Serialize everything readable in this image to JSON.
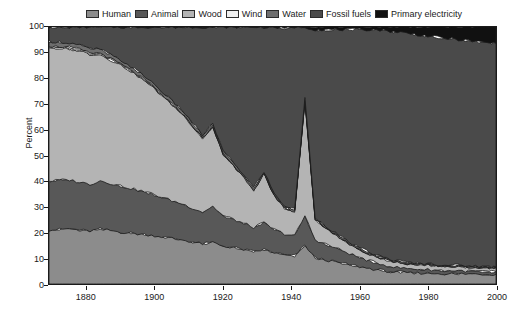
{
  "chart_data": {
    "type": "area",
    "stacked": true,
    "title": "",
    "xlabel": "",
    "ylabel": "Percent",
    "xlim": [
      1869,
      2000
    ],
    "ylim": [
      0,
      100
    ],
    "xticks": [
      1880,
      1900,
      1920,
      1940,
      1960,
      1980,
      2000
    ],
    "yticks": [
      0,
      10,
      20,
      30,
      40,
      50,
      60,
      70,
      80,
      90,
      100
    ],
    "grid": false,
    "legend_position": "top-center",
    "legend": [
      "Human",
      "Animal",
      "Wood",
      "Wind",
      "Water",
      "Fossil fuels",
      "Primary electricity"
    ],
    "colors": {
      "Human": "#8c8c8c",
      "Animal": "#585858",
      "Wood": "#b4b4b4",
      "Wind": "#efefef",
      "Water": "#6e6e6e",
      "Fossil fuels": "#4a4a4a",
      "Primary electricity": "#111111",
      "axis": "#1a1a1a",
      "background": "#ffffff"
    },
    "x": [
      1869,
      1872,
      1875,
      1878,
      1881,
      1884,
      1887,
      1890,
      1893,
      1896,
      1899,
      1902,
      1905,
      1908,
      1911,
      1914,
      1917,
      1920,
      1923,
      1926,
      1929,
      1932,
      1935,
      1938,
      1941,
      1944,
      1947,
      1950,
      1953,
      1956,
      1959,
      1962,
      1965,
      1968,
      1971,
      1974,
      1977,
      1980,
      1983,
      1986,
      1989,
      1992,
      1995,
      1998,
      2000
    ],
    "series": [
      {
        "name": "Human",
        "values": [
          21.0,
          21.2,
          21.5,
          21.0,
          20.6,
          21.4,
          20.8,
          20.2,
          19.8,
          19.4,
          19.0,
          18.4,
          17.8,
          17.2,
          16.4,
          15.6,
          16.2,
          14.8,
          14.2,
          13.4,
          12.6,
          13.4,
          12.2,
          11.4,
          11.0,
          15.0,
          10.2,
          9.4,
          8.6,
          7.8,
          7.0,
          6.2,
          5.6,
          5.0,
          4.6,
          4.4,
          4.3,
          4.2,
          4.1,
          4.0,
          4.0,
          3.9,
          3.9,
          3.8,
          3.8
        ]
      },
      {
        "name": "Animal",
        "values": [
          19.0,
          19.2,
          19.0,
          18.6,
          18.2,
          18.8,
          18.4,
          18.0,
          17.4,
          16.8,
          16.2,
          15.4,
          14.6,
          14.0,
          13.2,
          12.4,
          14.0,
          11.8,
          11.0,
          10.2,
          9.4,
          10.4,
          9.0,
          8.2,
          7.8,
          11.5,
          7.0,
          6.2,
          5.4,
          4.6,
          3.8,
          3.2,
          2.6,
          2.2,
          1.8,
          1.6,
          1.5,
          1.4,
          1.3,
          1.2,
          1.2,
          1.1,
          1.1,
          1.0,
          1.0
        ]
      },
      {
        "name": "Wood",
        "values": [
          52.0,
          51.4,
          51.0,
          51.2,
          50.6,
          49.2,
          48.0,
          47.0,
          45.6,
          43.8,
          42.0,
          39.6,
          37.4,
          35.0,
          32.0,
          28.6,
          31.0,
          24.0,
          21.0,
          18.0,
          14.6,
          19.0,
          13.0,
          10.2,
          9.4,
          45.0,
          8.0,
          6.4,
          5.0,
          4.0,
          3.2,
          2.8,
          2.4,
          2.2,
          2.0,
          1.9,
          1.8,
          1.8,
          1.7,
          1.7,
          1.6,
          1.6,
          1.5,
          1.5,
          1.5
        ]
      },
      {
        "name": "Wind",
        "values": [
          0.6,
          0.6,
          0.6,
          0.5,
          0.5,
          0.5,
          0.5,
          0.4,
          0.4,
          0.4,
          0.3,
          0.3,
          0.3,
          0.3,
          0.2,
          0.2,
          0.2,
          0.2,
          0.2,
          0.1,
          0.1,
          0.1,
          0.1,
          0.1,
          0.1,
          0.1,
          0.1,
          0.1,
          0.1,
          0.1,
          0.1,
          0.1,
          0.1,
          0.1,
          0.1,
          0.1,
          0.1,
          0.1,
          0.1,
          0.1,
          0.1,
          0.1,
          0.1,
          0.1,
          0.1
        ]
      },
      {
        "name": "Water",
        "values": [
          1.8,
          1.8,
          1.7,
          1.7,
          1.6,
          1.6,
          1.5,
          1.5,
          1.4,
          1.4,
          1.3,
          1.3,
          1.2,
          1.2,
          1.1,
          1.1,
          1.1,
          1.0,
          1.0,
          0.9,
          0.9,
          0.9,
          0.8,
          0.8,
          0.8,
          0.8,
          0.7,
          0.7,
          0.7,
          0.6,
          0.6,
          0.6,
          0.5,
          0.5,
          0.5,
          0.5,
          0.4,
          0.4,
          0.4,
          0.4,
          0.4,
          0.4,
          0.3,
          0.3,
          0.3
        ]
      },
      {
        "name": "Fossil fuels",
        "values": [
          5.6,
          5.8,
          6.2,
          7.0,
          8.5,
          8.5,
          10.8,
          12.9,
          15.4,
          18.2,
          21.2,
          25.0,
          28.7,
          32.3,
          37.1,
          42.1,
          37.5,
          48.2,
          52.6,
          57.4,
          62.4,
          56.2,
          64.9,
          69.3,
          70.9,
          27.6,
          73.0,
          76.2,
          79.2,
          81.9,
          84.3,
          86.1,
          87.8,
          88.5,
          89.1,
          89.1,
          88.9,
          88.6,
          88.4,
          88.1,
          87.8,
          87.6,
          87.3,
          87.1,
          87.0
        ]
      },
      {
        "name": "Primary electricity",
        "values": [
          0.0,
          0.0,
          0.0,
          0.0,
          0.0,
          0.0,
          0.0,
          0.0,
          0.0,
          0.0,
          0.0,
          0.0,
          0.0,
          0.0,
          0.0,
          0.0,
          0.0,
          0.0,
          0.0,
          0.0,
          0.0,
          0.0,
          0.0,
          0.6,
          0.0,
          0.0,
          1.0,
          1.0,
          1.0,
          1.0,
          1.0,
          1.0,
          1.0,
          1.5,
          1.9,
          2.4,
          3.0,
          3.5,
          4.0,
          4.5,
          4.9,
          5.3,
          5.8,
          6.2,
          6.3
        ]
      }
    ]
  }
}
